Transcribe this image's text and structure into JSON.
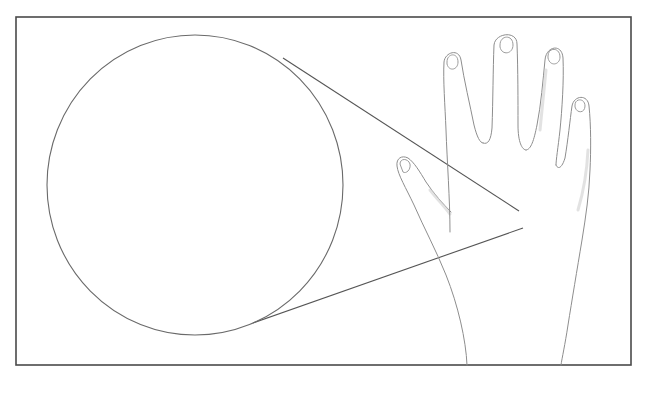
{
  "figure": {
    "subject": "Magnified dendritic cell in the skin of the back of a hand",
    "frame": {
      "x": 16,
      "y": 17,
      "width": 615,
      "height": 348,
      "stroke": "#4a4a4a"
    },
    "magnified_view": {
      "label": "magnified dendritic cell",
      "cx": 195,
      "cy": 185,
      "rx": 148,
      "ry": 150,
      "cell_body": {
        "cx": 199,
        "cy": 183,
        "r": 16,
        "color": "#555555"
      },
      "dendrite_color": "#6f6f6f"
    },
    "source_spot": {
      "label": "location on hand",
      "cx": 522,
      "cy": 219,
      "r": 9,
      "glyph": "✳"
    },
    "hand": {
      "label": "left hand, dorsal view",
      "outline_color": "#8d8d8d",
      "fingers": [
        "thumb",
        "index",
        "middle",
        "ring",
        "little"
      ]
    },
    "connector_lines": [
      {
        "from": [
          283,
          58
        ],
        "to": [
          519,
          211
        ]
      },
      {
        "from": [
          253,
          323
        ],
        "to": [
          523,
          228
        ]
      }
    ]
  }
}
